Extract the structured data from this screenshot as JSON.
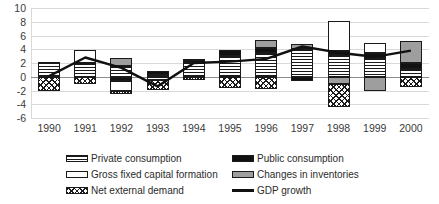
{
  "chart_data": {
    "type": "bar",
    "title": "",
    "subtitle": "",
    "xlabel": "",
    "ylabel": "",
    "grid": true,
    "stacked": true,
    "legend_position": "bottom",
    "ylim": [
      -6,
      10
    ],
    "ytick_step": 2,
    "yticks": [
      10,
      8,
      6,
      4,
      2,
      0,
      -2,
      -4,
      -6
    ],
    "categories": [
      "1990",
      "1991",
      "1992",
      "1993",
      "1994",
      "1995",
      "1996",
      "1997",
      "1998",
      "1999",
      "2000"
    ],
    "series": [
      {
        "name": "Private consumption",
        "pattern": "horizontal-lines",
        "color": "#ffffff",
        "values": [
          2.2,
          2.0,
          1.5,
          0.3,
          2.2,
          3.0,
          3.4,
          4.0,
          3.2,
          2.8,
          1.2
        ]
      },
      {
        "name": "Public consumption",
        "pattern": "solid-black",
        "color": "#111111",
        "values": [
          0.0,
          0.0,
          -0.6,
          0.5,
          0.2,
          0.9,
          0.8,
          -0.6,
          0.5,
          0.6,
          0.8
        ]
      },
      {
        "name": "Gross fixed capital formation",
        "pattern": "solid-white",
        "color": "#ffffff",
        "values": [
          0.0,
          1.9,
          -1.5,
          -0.4,
          0.0,
          0.0,
          0.0,
          0.0,
          4.4,
          1.5,
          0.0
        ]
      },
      {
        "name": "Changes in inventories",
        "pattern": "solid-gray",
        "color": "#9e9e9e",
        "values": [
          0.0,
          0.0,
          1.3,
          0.0,
          0.2,
          0.0,
          1.1,
          0.8,
          -1.1,
          -2.0,
          3.2
        ]
      },
      {
        "name": "Net external demand",
        "pattern": "cross-hatch",
        "color": "#ffffff",
        "values": [
          -2.1,
          -1.0,
          -0.4,
          -1.5,
          -0.4,
          -1.7,
          -1.8,
          0.0,
          -3.3,
          0.0,
          -1.5
        ]
      }
    ],
    "line_series": {
      "name": "GDP growth",
      "color": "#111111",
      "values": [
        0.1,
        2.8,
        1.3,
        -1.4,
        2.0,
        2.2,
        2.6,
        4.4,
        3.5,
        2.9,
        3.8
      ]
    }
  },
  "axis": {
    "ytick_labels": [
      "10",
      "8",
      "6",
      "4",
      "2",
      "0",
      "-2",
      "-4",
      "-6"
    ],
    "xtick_labels": [
      "1990",
      "1991",
      "1992",
      "1993",
      "1994",
      "1995",
      "1996",
      "1997",
      "1998",
      "1999",
      "2000"
    ]
  },
  "legend": {
    "entries": [
      {
        "label": "Private consumption",
        "swatch": "private-consumption-swatch"
      },
      {
        "label": "Public consumption",
        "swatch": "public-consumption-swatch"
      },
      {
        "label": "Gross fixed capital formation",
        "swatch": "gfcf-swatch"
      },
      {
        "label": "Changes in inventories",
        "swatch": "changes-in-inventories-swatch"
      },
      {
        "label": "Net external demand",
        "swatch": "net-external-demand-swatch"
      },
      {
        "label": "GDP growth",
        "swatch": "gdp-growth-line-swatch"
      }
    ]
  }
}
